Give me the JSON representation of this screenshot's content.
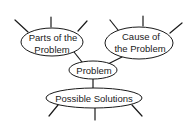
{
  "diagram": {
    "type": "concept-map",
    "nodes": {
      "parts": {
        "line1": "Parts of the",
        "line2": "Problem"
      },
      "cause": {
        "line1": "Cause of",
        "line2": "the Problem"
      },
      "problem": {
        "label": "Problem"
      },
      "solutions": {
        "label": "Possible Solutions"
      }
    },
    "edges": [
      {
        "from": "parts",
        "to": "problem"
      },
      {
        "from": "cause",
        "to": "problem"
      },
      {
        "from": "problem",
        "to": "solutions"
      }
    ],
    "colors": {
      "stroke": "#1a1a1a",
      "fill": "#ffffff"
    }
  }
}
